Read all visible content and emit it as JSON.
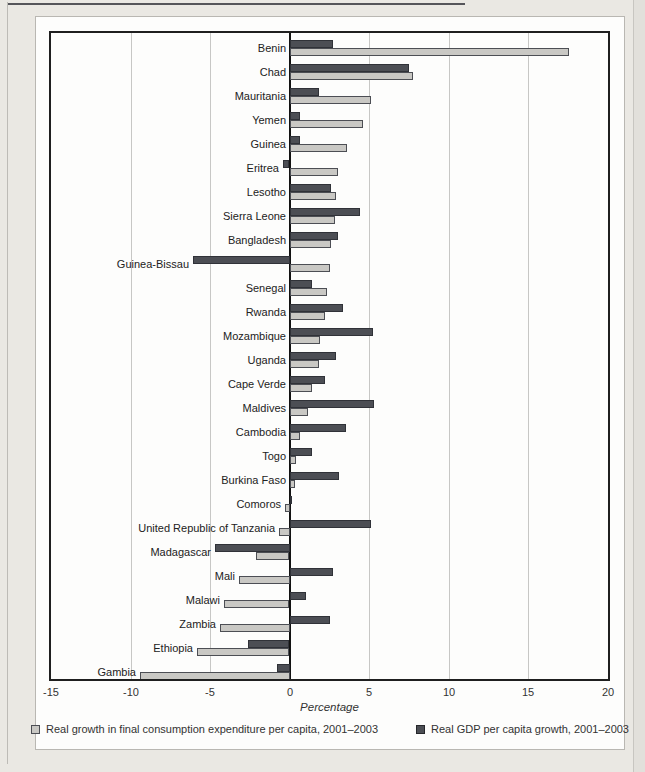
{
  "axis": {
    "tick_labels": [
      "-15",
      "-10",
      "-5",
      "0",
      "5",
      "10",
      "15",
      "20"
    ]
  },
  "chart_data": {
    "type": "bar",
    "orientation": "horizontal",
    "title": "",
    "xlabel": "Percentage",
    "ylabel": "",
    "xlim": [
      -15,
      20
    ],
    "xticks": [
      -15,
      -10,
      -5,
      0,
      5,
      10,
      15,
      20
    ],
    "grid": true,
    "legend_position": "bottom",
    "categories": [
      "Benin",
      "Chad",
      "Mauritania",
      "Yemen",
      "Guinea",
      "Eritrea",
      "Lesotho",
      "Sierra Leone",
      "Bangladesh",
      "Guinea-Bissau",
      "Senegal",
      "Rwanda",
      "Mozambique",
      "Uganda",
      "Cape Verde",
      "Maldives",
      "Cambodia",
      "Togo",
      "Burkina Faso",
      "Comoros",
      "United Republic of Tanzania",
      "Madagascar",
      "Mali",
      "Malawi",
      "Zambia",
      "Ethiopia",
      "Gambia"
    ],
    "series": [
      {
        "name": "Real growth in final consumption expenditure per capita, 2001–2003",
        "color": "#c9c8c4",
        "values": [
          17.5,
          7.7,
          5.1,
          4.6,
          3.6,
          3.0,
          2.9,
          2.8,
          2.6,
          2.5,
          2.3,
          2.2,
          1.9,
          1.8,
          1.4,
          1.1,
          0.6,
          0.4,
          0.3,
          -0.3,
          -0.7,
          -2.1,
          -3.2,
          -4.1,
          -4.4,
          -5.8,
          -9.4
        ]
      },
      {
        "name": "Real GDP per capita growth, 2001–2003",
        "color": "#4c4e54",
        "values": [
          2.7,
          7.5,
          1.8,
          0.6,
          0.6,
          -0.4,
          2.6,
          4.4,
          3.0,
          -6.1,
          1.4,
          3.3,
          5.2,
          2.9,
          2.2,
          5.3,
          3.5,
          1.4,
          3.1,
          0.1,
          5.1,
          -4.7,
          2.7,
          1.0,
          2.5,
          -2.6,
          -0.8
        ]
      }
    ]
  }
}
